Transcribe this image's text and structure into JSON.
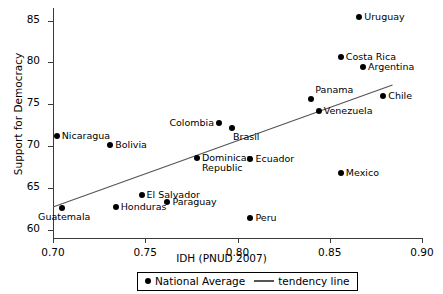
{
  "chart_data": {
    "type": "scatter",
    "title": "",
    "xlabel": "IDH (PNUD 2007)",
    "ylabel": "Support for Democracy",
    "xlim": [
      0.7,
      0.9
    ],
    "ylim": [
      59.0,
      86.5
    ],
    "xticks": [
      "0.70",
      "0.75",
      "0.80",
      "0.85",
      "0.90"
    ],
    "xtick_values": [
      0.7,
      0.75,
      0.8,
      0.85,
      0.9
    ],
    "yticks": [
      "60",
      "65",
      "70",
      "75",
      "80",
      "85"
    ],
    "ytick_values": [
      60,
      65,
      70,
      75,
      80,
      85
    ],
    "grid": false,
    "legend_position": "bottom-center",
    "series": [
      {
        "name": "National Average",
        "marker": "filled-circle",
        "color": "#000000",
        "points": [
          {
            "label": "Nicaragua",
            "x": 0.702,
            "y": 71.2,
            "label_pos": "right"
          },
          {
            "label": "Guatemala",
            "x": 0.705,
            "y": 62.6,
            "label_pos": "below-left"
          },
          {
            "label": "Bolivia",
            "x": 0.731,
            "y": 70.1,
            "label_pos": "right"
          },
          {
            "label": "Honduras",
            "x": 0.734,
            "y": 62.7,
            "label_pos": "right"
          },
          {
            "label": "El Salvador",
            "x": 0.748,
            "y": 64.2,
            "label_pos": "right"
          },
          {
            "label": "Paraguay",
            "x": 0.762,
            "y": 63.3,
            "label_pos": "right"
          },
          {
            "label": "Dominican\nRepublic",
            "x": 0.778,
            "y": 68.6,
            "label_pos": "right"
          },
          {
            "label": "Colombia",
            "x": 0.79,
            "y": 72.7,
            "label_pos": "left"
          },
          {
            "label": "Brasil",
            "x": 0.797,
            "y": 72.2,
            "label_pos": "below-right"
          },
          {
            "label": "Ecuador",
            "x": 0.807,
            "y": 68.5,
            "label_pos": "right"
          },
          {
            "label": "Peru",
            "x": 0.807,
            "y": 61.4,
            "label_pos": "right"
          },
          {
            "label": "Panama",
            "x": 0.84,
            "y": 75.6,
            "label_pos": "above-right"
          },
          {
            "label": "Venezuela",
            "x": 0.844,
            "y": 74.2,
            "label_pos": "right"
          },
          {
            "label": "Costa Rica",
            "x": 0.856,
            "y": 80.6,
            "label_pos": "right"
          },
          {
            "label": "Mexico",
            "x": 0.856,
            "y": 66.8,
            "label_pos": "right"
          },
          {
            "label": "Uruguay",
            "x": 0.866,
            "y": 85.4,
            "label_pos": "right"
          },
          {
            "label": "Argentina",
            "x": 0.868,
            "y": 79.5,
            "label_pos": "right"
          },
          {
            "label": "Chile",
            "x": 0.879,
            "y": 76.0,
            "label_pos": "right"
          }
        ]
      }
    ],
    "tendency_line": {
      "name": "tendency line",
      "color": "#555555",
      "x_start": 0.7,
      "y_start": 62.7,
      "x_end": 0.884,
      "y_end": 77.3
    }
  },
  "legend": {
    "national_average": "National Average",
    "tendency_line": "tendency line"
  },
  "axes": {
    "x_title": "IDH (PNUD 2007)",
    "y_title": "Support for Democracy"
  }
}
